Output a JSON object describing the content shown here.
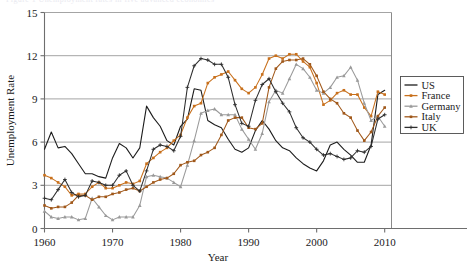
{
  "figure": {
    "background": "#ffffff",
    "ghost_caption": "Figure 1  Unemployment rates in five advanced economies"
  },
  "chart_data": {
    "type": "line",
    "title": "",
    "subtitle": "",
    "xlabel": "Year",
    "ylabel": "Unemployment Rate",
    "xlim": [
      1960,
      2011
    ],
    "ylim": [
      0,
      15
    ],
    "xticks": [
      1960,
      1970,
      1980,
      1990,
      2000,
      2010
    ],
    "xtick_labels": [
      "1960",
      "1970",
      "1980",
      "1990",
      "2000",
      "2010"
    ],
    "yticks": [
      0,
      3,
      6,
      9,
      12,
      15
    ],
    "ytick_labels": [
      "0",
      "3",
      "6",
      "9",
      "12",
      "15"
    ],
    "grid": "horizontal",
    "legend_position": "right-outside",
    "x": [
      1960,
      1961,
      1962,
      1963,
      1964,
      1965,
      1966,
      1967,
      1968,
      1969,
      1970,
      1971,
      1972,
      1973,
      1974,
      1975,
      1976,
      1977,
      1978,
      1979,
      1980,
      1981,
      1982,
      1983,
      1984,
      1985,
      1986,
      1987,
      1988,
      1989,
      1990,
      1991,
      1992,
      1993,
      1994,
      1995,
      1996,
      1997,
      1998,
      1999,
      2000,
      2001,
      2002,
      2003,
      2004,
      2005,
      2006,
      2007,
      2008,
      2009,
      2010
    ],
    "series": [
      {
        "name": "US",
        "color": "#1c1c1c",
        "marker": "none",
        "values": [
          5.5,
          6.7,
          5.6,
          5.7,
          5.2,
          4.5,
          3.8,
          3.8,
          3.6,
          3.5,
          4.9,
          5.9,
          5.6,
          4.9,
          5.6,
          8.5,
          7.7,
          7.1,
          6.1,
          5.8,
          7.1,
          7.6,
          9.7,
          9.6,
          7.5,
          7.2,
          7.0,
          6.2,
          5.5,
          5.3,
          5.6,
          6.8,
          7.5,
          6.9,
          6.1,
          5.6,
          5.4,
          4.9,
          4.5,
          4.2,
          4.0,
          4.7,
          5.8,
          6.0,
          5.5,
          5.1,
          4.6,
          4.6,
          5.8,
          9.3,
          9.6
        ]
      },
      {
        "name": "France",
        "color": "#c8701c",
        "marker": "square",
        "values": [
          3.7,
          3.5,
          3.2,
          2.9,
          2.3,
          2.4,
          2.4,
          2.9,
          3.2,
          2.8,
          2.8,
          3.0,
          3.2,
          3.1,
          3.3,
          4.5,
          4.9,
          5.3,
          5.6,
          6.1,
          6.5,
          7.7,
          8.5,
          8.7,
          10.1,
          10.5,
          10.7,
          10.9,
          10.3,
          9.7,
          9.4,
          9.8,
          10.7,
          11.8,
          12.0,
          11.8,
          12.1,
          12.1,
          11.6,
          11.2,
          10.1,
          8.6,
          8.9,
          9.4,
          9.6,
          9.3,
          9.3,
          8.4,
          7.8,
          9.5,
          9.3
        ]
      },
      {
        "name": "Germany",
        "color": "#9a9a9a",
        "marker": "triangle",
        "values": [
          1.2,
          0.8,
          0.7,
          0.8,
          0.8,
          0.6,
          0.7,
          2.1,
          1.5,
          0.9,
          0.6,
          0.8,
          0.8,
          0.8,
          1.6,
          3.6,
          3.7,
          3.6,
          3.5,
          3.2,
          2.9,
          4.4,
          6.1,
          8.0,
          8.2,
          8.3,
          7.9,
          7.9,
          7.9,
          6.9,
          6.2,
          5.5,
          6.6,
          8.8,
          9.6,
          9.4,
          10.4,
          11.4,
          11.1,
          10.5,
          9.6,
          9.4,
          9.8,
          10.5,
          10.6,
          11.2,
          10.3,
          8.7,
          7.5,
          7.8,
          7.1
        ]
      },
      {
        "name": "Italy",
        "color": "#a0581a",
        "marker": "square",
        "values": [
          1.6,
          1.4,
          1.5,
          1.5,
          1.8,
          2.3,
          2.3,
          2.0,
          2.2,
          2.2,
          2.4,
          2.5,
          2.7,
          2.8,
          2.6,
          2.9,
          3.2,
          3.4,
          3.5,
          3.8,
          4.4,
          4.6,
          4.7,
          5.1,
          5.3,
          5.6,
          6.5,
          7.5,
          7.7,
          7.7,
          7.0,
          6.9,
          7.3,
          9.8,
          11.1,
          11.6,
          11.7,
          11.7,
          11.8,
          11.4,
          10.6,
          9.5,
          9.0,
          8.7,
          8.0,
          7.7,
          6.8,
          6.1,
          6.7,
          7.8,
          8.4
        ]
      },
      {
        "name": "UK",
        "color": "#2e2e2e",
        "marker": "plus",
        "values": [
          2.1,
          2.0,
          2.7,
          3.4,
          2.5,
          2.2,
          2.3,
          3.3,
          3.2,
          3.0,
          3.0,
          3.7,
          4.0,
          3.0,
          2.6,
          4.0,
          5.5,
          5.8,
          5.7,
          5.4,
          6.4,
          9.8,
          11.3,
          11.8,
          11.7,
          11.4,
          11.4,
          10.5,
          8.6,
          7.3,
          7.1,
          8.9,
          10.0,
          10.4,
          9.5,
          8.7,
          8.1,
          7.0,
          6.3,
          6.0,
          5.5,
          5.1,
          5.2,
          5.0,
          4.8,
          4.9,
          5.4,
          5.3,
          5.7,
          7.6,
          7.9
        ]
      }
    ]
  },
  "legend": {
    "entries": [
      {
        "label": "US"
      },
      {
        "label": "France"
      },
      {
        "label": "Germany"
      },
      {
        "label": "Italy"
      },
      {
        "label": "UK"
      }
    ]
  }
}
